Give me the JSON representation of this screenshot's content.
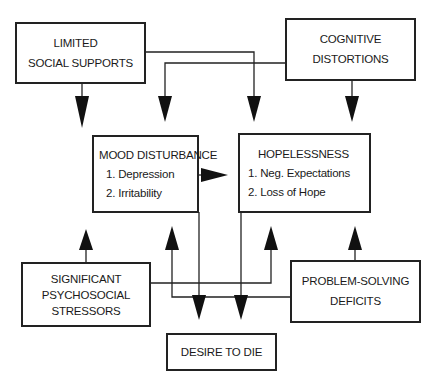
{
  "diagram": {
    "nodes": {
      "limited_social_supports": {
        "lines": [
          "LIMITED",
          "SOCIAL SUPPORTS"
        ]
      },
      "cognitive_distortions": {
        "lines": [
          "COGNITIVE",
          "DISTORTIONS"
        ]
      },
      "mood_disturbance": {
        "title": "MOOD DISTURBANCE",
        "items": [
          "1. Depression",
          "2. Irritability"
        ]
      },
      "hopelessness": {
        "title": "HOPELESSNESS",
        "items": [
          "1. Neg. Expectations",
          "2. Loss of Hope"
        ]
      },
      "significant_psychosocial_stressors": {
        "lines": [
          "SIGNIFICANT",
          "PSYCHOSOCIAL",
          "STRESSORS"
        ]
      },
      "problem_solving_deficits": {
        "lines": [
          "PROBLEM-SOLVING",
          "DEFICITS"
        ]
      },
      "desire_to_die": {
        "title": "DESIRE TO DIE"
      }
    },
    "edges": [
      {
        "from": "LIMITED SOCIAL SUPPORTS",
        "to": "MOOD DISTURBANCE"
      },
      {
        "from": "LIMITED SOCIAL SUPPORTS",
        "to": "HOPELESSNESS"
      },
      {
        "from": "COGNITIVE DISTORTIONS",
        "to": "MOOD DISTURBANCE"
      },
      {
        "from": "COGNITIVE DISTORTIONS",
        "to": "HOPELESSNESS"
      },
      {
        "from": "MOOD DISTURBANCE",
        "to": "HOPELESSNESS"
      },
      {
        "from": "SIGNIFICANT PSYCHOSOCIAL STRESSORS",
        "to": "MOOD DISTURBANCE"
      },
      {
        "from": "SIGNIFICANT PSYCHOSOCIAL STRESSORS",
        "to": "HOPELESSNESS"
      },
      {
        "from": "PROBLEM-SOLVING DEFICITS",
        "to": "HOPELESSNESS"
      },
      {
        "from": "PROBLEM-SOLVING DEFICITS",
        "to": "MOOD DISTURBANCE"
      },
      {
        "from": "MOOD DISTURBANCE",
        "to": "DESIRE TO DIE"
      },
      {
        "from": "HOPELESSNESS",
        "to": "DESIRE TO DIE"
      }
    ],
    "colors": {
      "line": "#222222",
      "background": "#ffffff"
    }
  }
}
